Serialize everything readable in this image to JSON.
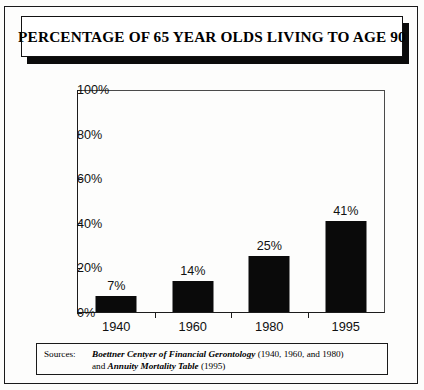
{
  "title": "PERCENTAGE OF 65 YEAR OLDS LIVING TO AGE 90",
  "chart_data": {
    "type": "bar",
    "title": "PERCENTAGE OF 65 YEAR OLDS LIVING TO AGE 90",
    "categories": [
      "1940",
      "1960",
      "1980",
      "1995"
    ],
    "values": [
      7,
      14,
      25,
      41
    ],
    "value_labels": [
      "7%",
      "14%",
      "25%",
      "41%"
    ],
    "xlabel": "",
    "ylabel": "",
    "ylim": [
      0,
      100
    ],
    "yticks": [
      0,
      20,
      40,
      60,
      80,
      100
    ],
    "ytick_labels": [
      "0%",
      "20%",
      "40%",
      "60%",
      "80%",
      "100%"
    ],
    "grid": false,
    "legend": false,
    "bar_color": "#0a0a0a"
  },
  "sources": {
    "label": "Sources:",
    "line1_italic": "Boettner Centyer of Financial Gerontology",
    "line1_rest": " (1940, 1960, and 1980)",
    "line2_lead": "and ",
    "line2_italic": "Annuity Mortality Table",
    "line2_rest": " (1995)"
  }
}
